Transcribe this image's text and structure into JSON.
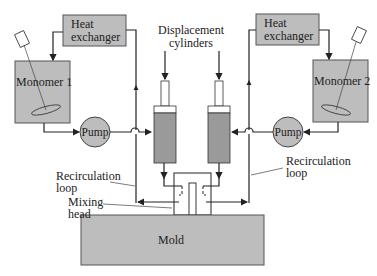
{
  "diagram": {
    "caption_fragment": "",
    "colors": {
      "component_fill": "#bdbdbd",
      "line": "#222222",
      "background": "#ffffff"
    },
    "left": {
      "heat_exchanger": [
        "Heat",
        "exchanger"
      ],
      "tank": "Monomer 1",
      "pump": "Pump",
      "recirculation_label": [
        "Recirculation",
        "loop"
      ]
    },
    "right": {
      "heat_exchanger": [
        "Heat",
        "exchanger"
      ],
      "tank": "Monomer 2",
      "pump": "Pump",
      "recirculation_label": [
        "Recirculation",
        "loop"
      ]
    },
    "center": {
      "displacement_label": [
        "Displacement",
        "cylinders"
      ],
      "mixing_head_label": [
        "Mixing",
        "head"
      ],
      "mold": "Mold"
    }
  }
}
